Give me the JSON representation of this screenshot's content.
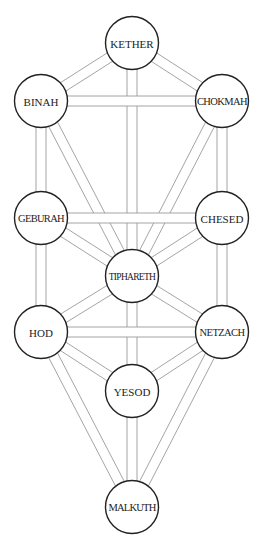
{
  "diagram": {
    "colors": {
      "background": "#ffffff",
      "node_stroke": "#222222",
      "node_fill": "#ffffff",
      "path_stroke": "#9a9a9a",
      "label": "#222222"
    },
    "node_radius": 26.5,
    "path_width": 10,
    "nodes": [
      {
        "id": "kether",
        "label": "KETHER",
        "x": 132,
        "y": 43,
        "font_size": 11,
        "letter_spacing": 0
      },
      {
        "id": "binah",
        "label": "BINAH",
        "x": 41,
        "y": 101,
        "font_size": 11,
        "letter_spacing": 0
      },
      {
        "id": "chokmah",
        "label": "CHOKMAH",
        "x": 222,
        "y": 101,
        "font_size": 10.5,
        "letter_spacing": -0.6
      },
      {
        "id": "geburah",
        "label": "GEBURAH",
        "x": 41,
        "y": 218,
        "font_size": 10.5,
        "letter_spacing": -0.7
      },
      {
        "id": "chesed",
        "label": "CHESED",
        "x": 222,
        "y": 218,
        "font_size": 11,
        "letter_spacing": 0
      },
      {
        "id": "tiphareth",
        "label": "TIPHARETH",
        "x": 132,
        "y": 276,
        "font_size": 9.5,
        "letter_spacing": -0.7
      },
      {
        "id": "hod",
        "label": "HOD",
        "x": 41,
        "y": 332,
        "font_size": 11,
        "letter_spacing": 0
      },
      {
        "id": "netzach",
        "label": "NETZACH",
        "x": 222,
        "y": 332,
        "font_size": 10.5,
        "letter_spacing": -0.6
      },
      {
        "id": "yesod",
        "label": "YESOD",
        "x": 132,
        "y": 391,
        "font_size": 11,
        "letter_spacing": 0
      },
      {
        "id": "malkuth",
        "label": "MALKUTH",
        "x": 132,
        "y": 507,
        "font_size": 10.5,
        "letter_spacing": -0.8
      }
    ],
    "paths_under": [
      [
        "kether",
        "binah"
      ],
      [
        "kether",
        "chokmah"
      ],
      [
        "kether",
        "tiphareth"
      ],
      [
        "binah",
        "geburah"
      ],
      [
        "binah",
        "tiphareth"
      ],
      [
        "chokmah",
        "chesed"
      ],
      [
        "chokmah",
        "tiphareth"
      ],
      [
        "geburah",
        "hod"
      ],
      [
        "geburah",
        "tiphareth"
      ],
      [
        "chesed",
        "netzach"
      ],
      [
        "chesed",
        "tiphareth"
      ],
      [
        "tiphareth",
        "hod"
      ],
      [
        "tiphareth",
        "netzach"
      ],
      [
        "tiphareth",
        "yesod"
      ],
      [
        "hod",
        "yesod"
      ],
      [
        "hod",
        "malkuth"
      ],
      [
        "netzach",
        "yesod"
      ],
      [
        "netzach",
        "malkuth"
      ],
      [
        "yesod",
        "malkuth"
      ]
    ],
    "paths_over": [
      [
        "binah",
        "chokmah"
      ],
      [
        "geburah",
        "chesed"
      ],
      [
        "hod",
        "netzach"
      ]
    ]
  }
}
